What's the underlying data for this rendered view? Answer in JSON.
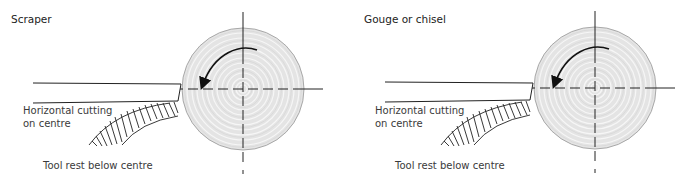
{
  "panels": [
    {
      "title": "Scraper",
      "cutting_label_line1": "Horizontal cutting",
      "cutting_label_line2": "on centre",
      "rest_label": "Tool rest below centre",
      "rotation": "anticlockwise"
    },
    {
      "title": "Gouge or chisel",
      "cutting_label_line1": "Horizontal cutting",
      "cutting_label_line2": "on centre",
      "rest_label": "Tool rest below centre",
      "rotation": "anticlockwise"
    }
  ],
  "colors": {
    "wood_fill": "#e4e4e4",
    "wood_ring": "#f4f4f4",
    "wood_outline": "#a8a8a8",
    "line": "#222222"
  }
}
